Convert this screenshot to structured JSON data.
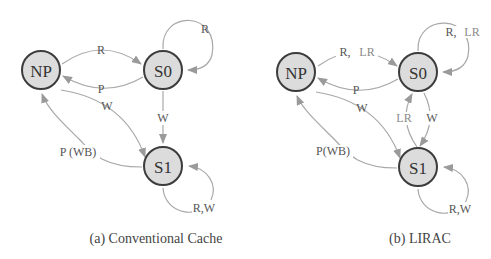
{
  "diagrams": [
    {
      "id": "a",
      "caption": "(a) Conventional Cache",
      "nodes": {
        "np": "NP",
        "s0": "S0",
        "s1": "S1"
      },
      "edges": {
        "np_s0": "R",
        "s0_np": "P",
        "s0_self": "R",
        "np_s1": "W",
        "s0_s1": "W",
        "s1_np": "P (WB)",
        "s1_self": "R,W"
      }
    },
    {
      "id": "b",
      "caption": "(b) LIRAC",
      "nodes": {
        "np": "NP",
        "s0": "S0",
        "s1": "S1"
      },
      "edges": {
        "np_s0_r": "R,",
        "np_s0_lr": "LR",
        "s0_np": "P",
        "s0_self_r": "R,",
        "s0_self_lr": "LR",
        "np_s1": "W",
        "s0_s1": "W",
        "s1_s0": "LR",
        "s1_np": "P(WB)",
        "s1_self": "R,W"
      }
    }
  ],
  "colors": {
    "node_fill": "#dcdcdc",
    "node_stroke": "#3c3c3c",
    "edge": "#a8a8a8",
    "lr_label": "#8a8a8a"
  }
}
